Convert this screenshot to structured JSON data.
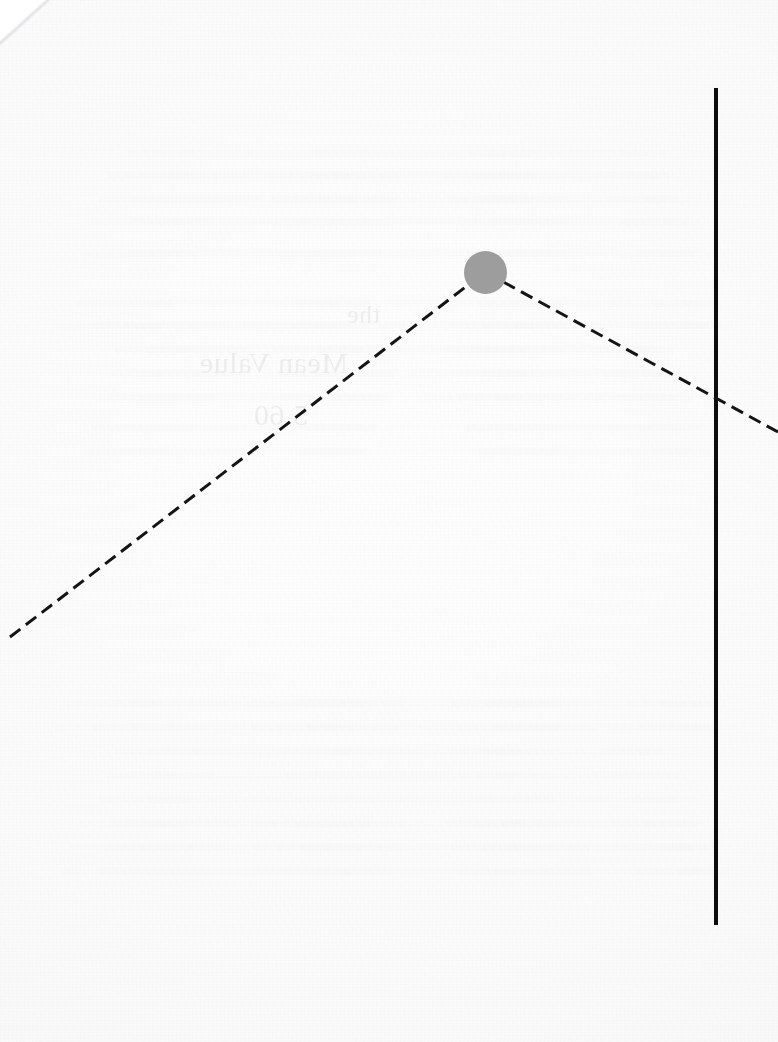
{
  "page": {
    "width": 778,
    "height": 1042,
    "medium": "scanned paper",
    "background_color": "#fbfbfb",
    "ink_color": "#111111",
    "marker_color": "#9d9d9d"
  },
  "artwork": {
    "title": "Dashed peak line with gray point marker and solid vertical rule",
    "vertical_rule": {
      "name": "vertical-rule",
      "color": "#0d0d0d",
      "stroke_width": 4,
      "x": 716,
      "y_top": 88,
      "y_bottom": 925,
      "style": "solid"
    },
    "dashed_path": {
      "name": "dashed-peak-path",
      "color": "#141414",
      "stroke_width": 3,
      "style": "dashed",
      "dash_length": 13,
      "gap_length": 7,
      "points": [
        {
          "label": "left-end",
          "x": 10,
          "y": 637
        },
        {
          "label": "apex",
          "x": 485,
          "y": 272
        },
        {
          "label": "right-end",
          "x": 778,
          "y": 432
        }
      ]
    },
    "marker": {
      "name": "apex-point-marker",
      "shape": "circle",
      "fill": "#9d9d9d",
      "cx": 485.5,
      "cy": 272.5,
      "r": 21.5
    },
    "intersection": {
      "name": "path-rule-intersection",
      "x": 716,
      "y": 398
    }
  },
  "bleed_through": {
    "description": "Faint mirrored show-through of text printed on the reverse of the sheet; illegible.",
    "bands_y": [
      150,
      172,
      196,
      218,
      250,
      300,
      322,
      346,
      370,
      394,
      424,
      448,
      700,
      724,
      748,
      772,
      796,
      820,
      844,
      868
    ],
    "fragments": [
      {
        "text": "Mean Value",
        "x": 430,
        "y": 346,
        "size": 30
      },
      {
        "text": "5.60",
        "x": 470,
        "y": 398,
        "size": 30
      },
      {
        "text": "the",
        "x": 398,
        "y": 300,
        "size": 26
      }
    ]
  }
}
